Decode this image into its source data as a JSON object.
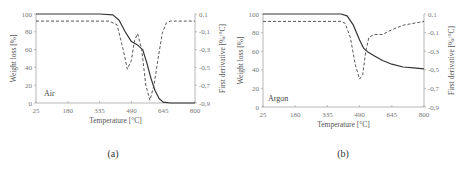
{
  "chart_data": [
    {
      "type": "line",
      "caption": "(a)",
      "annotation": "Air",
      "xlabel": "Temperature [°C]",
      "ylabel": "Weight loss [%]",
      "y2label": "First derivative [%/°C]",
      "xticks": [
        "25",
        "180",
        "335",
        "490",
        "645",
        "800"
      ],
      "yticks": [
        "0",
        "20",
        "40",
        "60",
        "80",
        "100"
      ],
      "y2ticks": [
        "-0,9",
        "-0,7",
        "-0,5",
        "-0,3",
        "-0,1",
        "0,1"
      ],
      "xlim": [
        25,
        800
      ],
      "ylim": [
        0,
        100
      ],
      "y2lim": [
        -0.9,
        0.1
      ],
      "grid": false,
      "series": [
        {
          "name": "Weight loss",
          "style": "solid",
          "axis": "left",
          "x": [
            25,
            335,
            400,
            430,
            460,
            490,
            520,
            545,
            565,
            585,
            605,
            625,
            645,
            680,
            800
          ],
          "y": [
            100,
            100,
            99,
            93,
            80,
            69,
            65,
            60,
            45,
            28,
            14,
            5,
            1,
            0,
            0
          ]
        },
        {
          "name": "First derivative",
          "style": "dashed",
          "axis": "right",
          "x": [
            25,
            380,
            420,
            450,
            470,
            490,
            505,
            520,
            540,
            560,
            580,
            600,
            620,
            640,
            660,
            680,
            800
          ],
          "y": [
            0.02,
            0.02,
            -0.02,
            -0.3,
            -0.52,
            -0.42,
            -0.2,
            -0.12,
            -0.3,
            -0.7,
            -0.87,
            -0.7,
            -0.4,
            -0.12,
            0.0,
            0.02,
            0.02
          ]
        }
      ]
    },
    {
      "type": "line",
      "caption": "(b)",
      "annotation": "Argon",
      "xlabel": "Temperature [°C]",
      "ylabel": "Weight loss [%]",
      "y2label": "First derivative [%/°C]",
      "xticks": [
        "25",
        "180",
        "335",
        "490",
        "645",
        "800"
      ],
      "yticks": [
        "0",
        "20",
        "40",
        "60",
        "80",
        "100"
      ],
      "y2ticks": [
        "-0,9",
        "-0,7",
        "-0,5",
        "-0,3",
        "-0,1",
        "0,1"
      ],
      "xlim": [
        25,
        800
      ],
      "ylim": [
        0,
        100
      ],
      "y2lim": [
        -0.9,
        0.1
      ],
      "grid": false,
      "series": [
        {
          "name": "Weight loss",
          "style": "solid",
          "axis": "left",
          "x": [
            25,
            400,
            430,
            460,
            490,
            510,
            530,
            560,
            600,
            645,
            700,
            750,
            800
          ],
          "y": [
            100,
            100,
            98,
            88,
            72,
            63,
            59,
            55,
            50,
            46,
            43,
            42,
            41
          ]
        },
        {
          "name": "First derivative",
          "style": "dashed",
          "axis": "right",
          "x": [
            25,
            400,
            420,
            445,
            470,
            490,
            505,
            520,
            535,
            560,
            600,
            645,
            700,
            800
          ],
          "y": [
            0.02,
            0.02,
            0.0,
            -0.15,
            -0.45,
            -0.6,
            -0.55,
            -0.3,
            -0.15,
            -0.12,
            -0.12,
            -0.07,
            -0.02,
            0.02
          ]
        }
      ]
    }
  ]
}
